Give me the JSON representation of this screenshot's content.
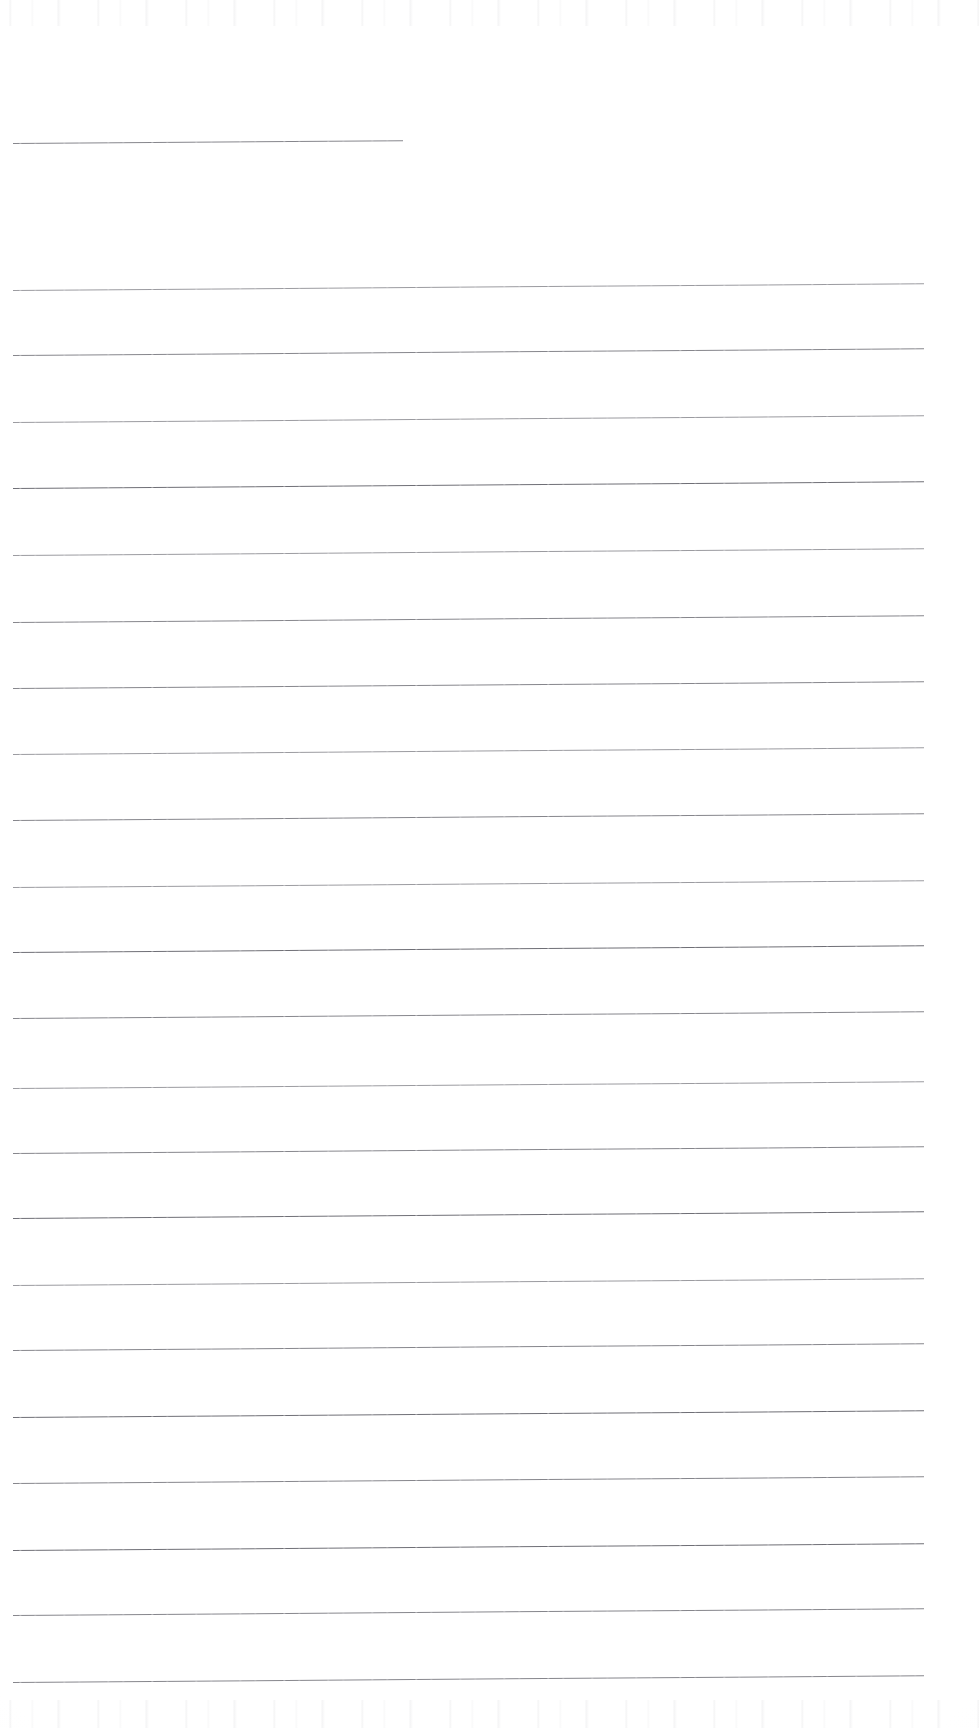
{
  "document": {
    "kind": "scanned-lined-paper",
    "title": "Blank Ruled Notebook Page",
    "background_color": "#ffffff",
    "rule_color": "#86868c",
    "page_width": 979,
    "page_height": 1728,
    "handwriting_text": "",
    "printed_text": "",
    "notes_count": 0
  },
  "geometry": {
    "rule_left_x": 13,
    "rule_right_x": 924,
    "rule_thickness_px": 1,
    "rule_spacing_px": 66,
    "rule_slope_deg": -0.42,
    "first_rule_y": 143,
    "last_rule_y": 1682,
    "total_rules": 23
  },
  "rules": [
    {
      "id": "rule-01",
      "y": 143,
      "x": 13,
      "width": 390,
      "ink": "ink-mid",
      "short": true
    },
    {
      "id": "rule-02",
      "y": 290,
      "x": 13,
      "width": 911,
      "ink": "ink-light",
      "short": false
    },
    {
      "id": "rule-03",
      "y": 355,
      "x": 13,
      "width": 911,
      "ink": "ink-mid",
      "short": false
    },
    {
      "id": "rule-04",
      "y": 422,
      "x": 13,
      "width": 911,
      "ink": "ink-light",
      "short": false
    },
    {
      "id": "rule-05",
      "y": 488,
      "x": 13,
      "width": 911,
      "ink": "ink-dark",
      "short": false
    },
    {
      "id": "rule-06",
      "y": 555,
      "x": 13,
      "width": 911,
      "ink": "ink-light",
      "short": false
    },
    {
      "id": "rule-07",
      "y": 622,
      "x": 13,
      "width": 911,
      "ink": "ink-mid",
      "short": false
    },
    {
      "id": "rule-08",
      "y": 688,
      "x": 13,
      "width": 911,
      "ink": "ink-mid",
      "short": false
    },
    {
      "id": "rule-09",
      "y": 754,
      "x": 13,
      "width": 911,
      "ink": "ink-light",
      "short": false
    },
    {
      "id": "rule-10",
      "y": 820,
      "x": 13,
      "width": 911,
      "ink": "ink-mid",
      "short": false
    },
    {
      "id": "rule-11",
      "y": 887,
      "x": 13,
      "width": 911,
      "ink": "ink-light",
      "short": false
    },
    {
      "id": "rule-12",
      "y": 952,
      "x": 13,
      "width": 911,
      "ink": "ink-dark",
      "short": false
    },
    {
      "id": "rule-13",
      "y": 1018,
      "x": 13,
      "width": 911,
      "ink": "ink-mid",
      "short": false
    },
    {
      "id": "rule-14",
      "y": 1088,
      "x": 13,
      "width": 911,
      "ink": "ink-light",
      "short": false
    },
    {
      "id": "rule-15",
      "y": 1153,
      "x": 13,
      "width": 911,
      "ink": "ink-mid",
      "short": false
    },
    {
      "id": "rule-16",
      "y": 1218,
      "x": 13,
      "width": 911,
      "ink": "ink-dark",
      "short": false
    },
    {
      "id": "rule-17",
      "y": 1285,
      "x": 13,
      "width": 911,
      "ink": "ink-light",
      "short": false
    },
    {
      "id": "rule-18",
      "y": 1350,
      "x": 13,
      "width": 911,
      "ink": "ink-mid",
      "short": false
    },
    {
      "id": "rule-19",
      "y": 1417,
      "x": 13,
      "width": 911,
      "ink": "ink-dark",
      "short": false
    },
    {
      "id": "rule-20",
      "y": 1483,
      "x": 13,
      "width": 911,
      "ink": "ink-mid",
      "short": false
    },
    {
      "id": "rule-21",
      "y": 1550,
      "x": 13,
      "width": 911,
      "ink": "ink-dark",
      "short": false
    },
    {
      "id": "rule-22",
      "y": 1615,
      "x": 13,
      "width": 911,
      "ink": "ink-mid",
      "short": false
    },
    {
      "id": "rule-23",
      "y": 1682,
      "x": 13,
      "width": 911,
      "ink": "ink-mid",
      "short": false
    }
  ]
}
